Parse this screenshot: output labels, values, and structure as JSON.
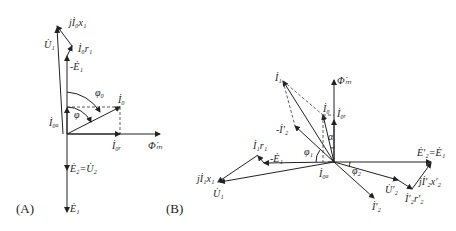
{
  "diagram_a": {
    "caption": "(A)",
    "labels": {
      "j_i0_x1": "jİ₀x₁",
      "u1": "U̇₁",
      "i0_r1": "İ₀r₁",
      "neg_e1": "-Ė₁",
      "phi0": "φ₀",
      "i0": "İ₀",
      "phi": "φ",
      "i0a": "İ₀ₐ",
      "i0r": "İ₀ᵣ",
      "phi_m": "Φ̇ₘ",
      "e2_u2": "Ė₂=U̇₂",
      "e1": "Ė₁"
    }
  },
  "diagram_b": {
    "caption": "(B)",
    "labels": {
      "i1": "İ₁",
      "phi_m": "Φ̇ₘ",
      "i0": "İ₀",
      "i0r": "İ₀ᵣ",
      "neg_i2p": "-İ′₂",
      "alpha": "α",
      "i1_r1": "İ₁r₁",
      "neg_e1": "-Ė₁",
      "phi1": "φ₁",
      "j_i1_x1": "jİ₁x₁",
      "u1": "U̇₁",
      "i0a": "İ₀ₐ",
      "phi2": "φ₂",
      "e2p_e1": "Ė′₂=Ė₁",
      "u2p": "U̇′₂",
      "j_i2p_x2p": "jİ′₂x′₂",
      "i2p_r2p": "İ′₂r′₂",
      "i2p": "İ′₂"
    }
  }
}
